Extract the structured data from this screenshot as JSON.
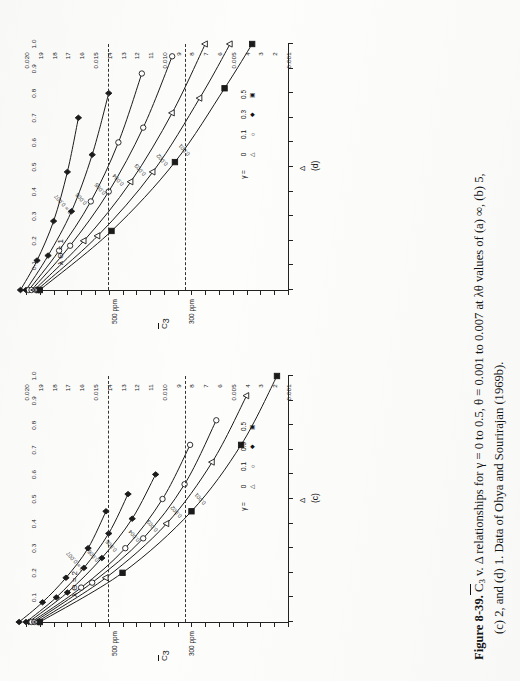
{
  "figure": {
    "number": "Figure 8-39.",
    "caption_line1_pre": "  C",
    "caption_line1_sub": "3",
    "caption_line1_post": " v. Δ relationships for γ = 0 to 0.5, θ = 0.001 to 0.007 at λθ values of (a) ∞, (b) 5,",
    "caption_line2": "(c) 2, and (d) 1. Data of Ohya and Sourirajan (1969b).",
    "source": "Data of Ohya and Sourirajan (1969b)."
  },
  "legend": {
    "title": "γ =",
    "values": [
      "0",
      "0.1",
      "0.3",
      "0.5"
    ],
    "symbols": [
      "triangle",
      "circle",
      "diamond",
      "square"
    ]
  },
  "axes": {
    "x_title": "Δ",
    "y_title_pre": "C",
    "y_title_sub": "3",
    "x_ticks": [
      "0",
      "0.1",
      "0.2",
      "0.3",
      "0.4",
      "0.5",
      "0.6",
      "0.7",
      "0.8",
      "0.9",
      "1.0"
    ],
    "y_ticks": [
      "0.001",
      "2",
      "3",
      "4",
      "0.005",
      "6",
      "7",
      "8",
      "9",
      "0.010",
      "11",
      "12",
      "13",
      "14",
      "0.015",
      "16",
      "17",
      "18",
      "19",
      "0.020"
    ],
    "x_min": 0,
    "x_max": 1.0,
    "y_min": 0.001,
    "y_max": 0.02
  },
  "guides": [
    {
      "label": "500 ppm",
      "y_value": 0.014
    },
    {
      "label": "300 ppm",
      "y_value": 0.0084
    }
  ],
  "panels": [
    {
      "id": "(c)",
      "lambda_theta_label": "λ Θ = 2",
      "lambda_theta": 2
    },
    {
      "id": "(d)",
      "lambda_theta_label": "λ Θ = 1",
      "lambda_theta": 1
    }
  ],
  "chart_data": {
    "type": "line",
    "xlabel": "Δ",
    "ylabel": "C̅3",
    "xlim": [
      0,
      1.0
    ],
    "ylim": [
      0.001,
      0.02
    ],
    "grid": false,
    "legend_position": "lower-right",
    "annotations": [
      "500 ppm",
      "300 ppm",
      "θ = 0.007",
      "0.006",
      "0.005",
      "0.004",
      "0.003",
      "0.002",
      "0.001"
    ],
    "panels": [
      {
        "panel": "(c)",
        "lambda_theta": 2,
        "curve_labels": [
          "θ = 0.007",
          "0.006",
          "0.005",
          "0.004",
          "0.003",
          "0.002",
          "0.001"
        ],
        "series": [
          {
            "name": "theta=0.007, gamma=0",
            "theta": 0.007,
            "gamma": 0,
            "symbol": "diamond",
            "x": [
              0.0,
              0.08,
              0.18,
              0.3,
              0.45
            ],
            "y": [
              0.0205,
              0.0188,
              0.0171,
              0.0155,
              0.0142
            ]
          },
          {
            "name": "theta=0.006, gamma=0",
            "theta": 0.006,
            "gamma": 0,
            "symbol": "diamond",
            "x": [
              0.0,
              0.1,
              0.22,
              0.36,
              0.52
            ],
            "y": [
              0.02,
              0.0178,
              0.0158,
              0.014,
              0.0126
            ]
          },
          {
            "name": "theta=0.005, gamma=0",
            "theta": 0.005,
            "gamma": 0,
            "symbol": "diamond",
            "x": [
              0.0,
              0.12,
              0.26,
              0.42,
              0.6
            ],
            "y": [
              0.0198,
              0.017,
              0.0145,
              0.0123,
              0.0106
            ]
          },
          {
            "name": "theta=0.004, gamma=0.1",
            "theta": 0.004,
            "gamma": 0.1,
            "symbol": "circle",
            "x": [
              0.0,
              0.14,
              0.3,
              0.5,
              0.72
            ],
            "y": [
              0.0196,
              0.016,
              0.0128,
              0.0101,
              0.0081
            ]
          },
          {
            "name": "theta=0.003, gamma=0.1",
            "theta": 0.003,
            "gamma": 0.1,
            "symbol": "circle",
            "x": [
              0.0,
              0.16,
              0.34,
              0.56,
              0.82
            ],
            "y": [
              0.0194,
              0.0152,
              0.0115,
              0.0085,
              0.0062
            ]
          },
          {
            "name": "theta=0.002, gamma=0.3",
            "theta": 0.002,
            "gamma": 0.3,
            "symbol": "triangle",
            "x": [
              0.0,
              0.18,
              0.4,
              0.65,
              0.92
            ],
            "y": [
              0.0192,
              0.0142,
              0.0098,
              0.0065,
              0.004
            ]
          },
          {
            "name": "theta=0.001, gamma=0.5",
            "theta": 0.001,
            "gamma": 0.5,
            "symbol": "square",
            "x": [
              0.0,
              0.2,
              0.45,
              0.72,
              1.0
            ],
            "y": [
              0.019,
              0.013,
              0.008,
              0.0044,
              0.0018
            ]
          }
        ]
      },
      {
        "panel": "(d)",
        "lambda_theta": 1,
        "curve_labels": [
          "θ = 0.007",
          "0.006",
          "0.005",
          "0.004",
          "0.003",
          "0.002",
          "0.001"
        ],
        "series": [
          {
            "name": "theta=0.007, gamma=0",
            "theta": 0.007,
            "gamma": 0,
            "symbol": "diamond",
            "x": [
              0.0,
              0.12,
              0.28,
              0.48,
              0.7
            ],
            "y": [
              0.0204,
              0.0192,
              0.018,
              0.017,
              0.0162
            ]
          },
          {
            "name": "theta=0.006, gamma=0",
            "theta": 0.006,
            "gamma": 0,
            "symbol": "diamond",
            "x": [
              0.0,
              0.14,
              0.32,
              0.55,
              0.8
            ],
            "y": [
              0.02,
              0.0184,
              0.0167,
              0.0152,
              0.014
            ]
          },
          {
            "name": "theta=0.005, gamma=0.1",
            "theta": 0.005,
            "gamma": 0.1,
            "symbol": "circle",
            "x": [
              0.0,
              0.16,
              0.36,
              0.6,
              0.88
            ],
            "y": [
              0.0198,
              0.0176,
              0.0153,
              0.0133,
              0.0116
            ]
          },
          {
            "name": "theta=0.004, gamma=0.1",
            "theta": 0.004,
            "gamma": 0.1,
            "symbol": "circle",
            "x": [
              0.0,
              0.18,
              0.4,
              0.66,
              0.95
            ],
            "y": [
              0.0196,
              0.0168,
              0.014,
              0.0115,
              0.0094
            ]
          },
          {
            "name": "theta=0.003, gamma=0.3",
            "theta": 0.003,
            "gamma": 0.3,
            "symbol": "triangle",
            "x": [
              0.0,
              0.2,
              0.44,
              0.72,
              1.0
            ],
            "y": [
              0.0194,
              0.0158,
              0.0124,
              0.0094,
              0.007
            ]
          },
          {
            "name": "theta=0.002, gamma=0.3",
            "theta": 0.002,
            "gamma": 0.3,
            "symbol": "triangle",
            "x": [
              0.0,
              0.22,
              0.48,
              0.78,
              1.0
            ],
            "y": [
              0.0192,
              0.0148,
              0.0108,
              0.0074,
              0.0052
            ]
          },
          {
            "name": "theta=0.001, gamma=0.5",
            "theta": 0.001,
            "gamma": 0.5,
            "symbol": "square",
            "x": [
              0.0,
              0.24,
              0.52,
              0.82,
              1.0
            ],
            "y": [
              0.019,
              0.0138,
              0.0092,
              0.0056,
              0.0036
            ]
          }
        ]
      }
    ]
  }
}
